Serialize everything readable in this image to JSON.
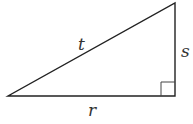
{
  "diagram": {
    "type": "right-triangle",
    "labels": {
      "hypotenuse": "t",
      "vertical_leg": "s",
      "horizontal_leg": "r"
    },
    "right_angle_marker": true,
    "stroke_color": "#222222"
  }
}
